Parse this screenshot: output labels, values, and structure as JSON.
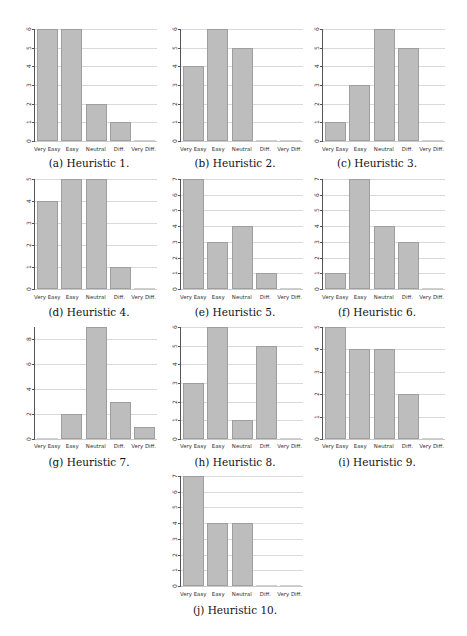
{
  "chart_data": [
    {
      "type": "bar",
      "id": "a",
      "title": "(a) Heuristic 1.",
      "categories": [
        "Very Easy",
        "Easy",
        "Neutral",
        "Diff.",
        "Very Diff."
      ],
      "values": [
        6,
        6,
        2,
        1,
        0
      ],
      "ylim": [
        0,
        6
      ],
      "yticks": [
        0,
        1,
        2,
        3,
        4,
        5,
        6
      ],
      "xlabel": "",
      "ylabel": "",
      "grid": true
    },
    {
      "type": "bar",
      "id": "b",
      "title": "(b) Heuristic 2.",
      "categories": [
        "Very Easy",
        "Easy",
        "Neutral",
        "Diff.",
        "Very Diff."
      ],
      "values": [
        4,
        6,
        5,
        0,
        0
      ],
      "ylim": [
        0,
        6
      ],
      "yticks": [
        0,
        1,
        2,
        3,
        4,
        5,
        6
      ],
      "xlabel": "",
      "ylabel": "",
      "grid": true
    },
    {
      "type": "bar",
      "id": "c",
      "title": "(c) Heuristic 3.",
      "categories": [
        "Very Easy",
        "Easy",
        "Neutral",
        "Diff.",
        "Very Diff."
      ],
      "values": [
        1,
        3,
        6,
        5,
        0
      ],
      "ylim": [
        0,
        6
      ],
      "yticks": [
        0,
        1,
        2,
        3,
        4,
        5,
        6
      ],
      "xlabel": "",
      "ylabel": "",
      "grid": true
    },
    {
      "type": "bar",
      "id": "d",
      "title": "(d) Heuristic 4.",
      "categories": [
        "Very Easy",
        "Easy",
        "Neutral",
        "Diff.",
        "Very Diff."
      ],
      "values": [
        4,
        5,
        5,
        1,
        0
      ],
      "ylim": [
        0,
        5
      ],
      "yticks": [
        0,
        1,
        2,
        3,
        4,
        5
      ],
      "xlabel": "",
      "ylabel": "",
      "grid": true
    },
    {
      "type": "bar",
      "id": "e",
      "title": "(e) Heuristic 5.",
      "categories": [
        "Very Easy",
        "Easy",
        "Neutral",
        "Diff.",
        "Very Diff."
      ],
      "values": [
        7,
        3,
        4,
        1,
        0
      ],
      "ylim": [
        0,
        7
      ],
      "yticks": [
        0,
        1,
        2,
        3,
        4,
        5,
        6,
        7
      ],
      "xlabel": "",
      "ylabel": "",
      "grid": true
    },
    {
      "type": "bar",
      "id": "f",
      "title": "(f) Heuristic 6.",
      "categories": [
        "Very Easy",
        "Easy",
        "Neutral",
        "Diff.",
        "Very Diff."
      ],
      "values": [
        1,
        7,
        4,
        3,
        0
      ],
      "ylim": [
        0,
        7
      ],
      "yticks": [
        0,
        1,
        2,
        3,
        4,
        5,
        6,
        7
      ],
      "xlabel": "",
      "ylabel": "",
      "grid": true
    },
    {
      "type": "bar",
      "id": "g",
      "title": "(g) Heuristic 7.",
      "categories": [
        "Very Easy",
        "Easy",
        "Neutral",
        "Diff.",
        "Very Diff."
      ],
      "values": [
        0,
        2,
        9,
        3,
        1
      ],
      "ylim": [
        0,
        9
      ],
      "yticks": [
        0,
        2,
        4,
        6,
        8
      ],
      "xlabel": "",
      "ylabel": "",
      "grid": true
    },
    {
      "type": "bar",
      "id": "h",
      "title": "(h) Heuristic 8.",
      "categories": [
        "Very Easy",
        "Easy",
        "Neutral",
        "Diff.",
        "Very Diff."
      ],
      "values": [
        3,
        6,
        1,
        5,
        0
      ],
      "ylim": [
        0,
        6
      ],
      "yticks": [
        0,
        1,
        2,
        3,
        4,
        5,
        6
      ],
      "xlabel": "",
      "ylabel": "",
      "grid": true
    },
    {
      "type": "bar",
      "id": "i",
      "title": "(i) Heuristic 9.",
      "categories": [
        "Very Easy",
        "Easy",
        "Neutral",
        "Diff.",
        "Very Diff."
      ],
      "values": [
        5,
        4,
        4,
        2,
        0
      ],
      "ylim": [
        0,
        5
      ],
      "yticks": [
        0,
        1,
        2,
        3,
        4,
        5
      ],
      "xlabel": "",
      "ylabel": "",
      "grid": true
    },
    {
      "type": "bar",
      "id": "j",
      "title": "(j) Heuristic 10.",
      "categories": [
        "Very Easy",
        "Easy",
        "Neutral",
        "Diff.",
        "Very Diff."
      ],
      "values": [
        7,
        4,
        4,
        0,
        0
      ],
      "ylim": [
        0,
        7
      ],
      "yticks": [
        0,
        1,
        2,
        3,
        4,
        5,
        6,
        7
      ],
      "xlabel": "",
      "ylabel": "",
      "grid": true
    }
  ],
  "layout": {
    "panels": [
      {
        "left": 4,
        "top": 29,
        "height": 112,
        "labelTop": 146,
        "captionTop": 157
      },
      {
        "left": 150,
        "top": 29,
        "height": 112,
        "labelTop": 146,
        "captionTop": 157
      },
      {
        "left": 292,
        "top": 29,
        "height": 112,
        "labelTop": 146,
        "captionTop": 157
      },
      {
        "left": 4,
        "top": 179,
        "height": 110,
        "labelTop": 294,
        "captionTop": 306
      },
      {
        "left": 150,
        "top": 179,
        "height": 110,
        "labelTop": 294,
        "captionTop": 306
      },
      {
        "left": 292,
        "top": 179,
        "height": 110,
        "labelTop": 294,
        "captionTop": 306
      },
      {
        "left": 4,
        "top": 327,
        "height": 112,
        "labelTop": 443,
        "captionTop": 456
      },
      {
        "left": 150,
        "top": 327,
        "height": 112,
        "labelTop": 443,
        "captionTop": 456
      },
      {
        "left": 292,
        "top": 327,
        "height": 112,
        "labelTop": 443,
        "captionTop": 456
      },
      {
        "left": 150,
        "top": 476,
        "height": 110,
        "labelTop": 591,
        "captionTop": 604
      }
    ],
    "colors": {
      "bar": "#bdbdbd",
      "bar_edge": "#9e9e9e",
      "grid": "#d9d9d9"
    }
  }
}
